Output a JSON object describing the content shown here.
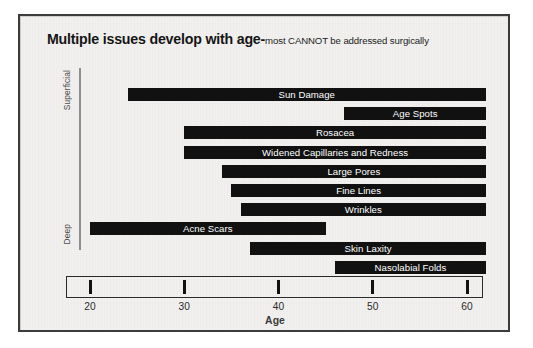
{
  "title": {
    "main": "Multiple issues develop with age-",
    "subtitle": "most CANNOT be addressed surgically"
  },
  "depth_axis": {
    "top_label": "Superficial",
    "bottom_label": "Deep"
  },
  "colors": {
    "bar": "#111111",
    "bar_text": "#ffffff",
    "background": "#f2f1ef",
    "frame_border": "#3b3b3b",
    "axis": "#2a2a2a",
    "depth_axis": "#8d8d8d"
  },
  "chart_data": {
    "type": "bar",
    "orientation": "horizontal",
    "variant": "range-bar",
    "xlabel": "Age",
    "ylabel": "",
    "xlim": [
      17,
      63
    ],
    "xticks": [
      20,
      30,
      40,
      50,
      60
    ],
    "xtick_labels": [
      "20",
      "30",
      "40",
      "50",
      "60"
    ],
    "grid": false,
    "legend": false,
    "y_axis_annotation": {
      "top": "Superficial",
      "bottom": "Deep"
    },
    "categories": [
      "Sun Damage",
      "Age Spots",
      "Rosacea",
      "Widened Capillaries and Redness",
      "Large Pores",
      "Fine Lines",
      "Wrinkles",
      "Acne Scars",
      "Skin Laxity",
      "Nasolabial Folds"
    ],
    "ranges": [
      {
        "label": "Sun Damage",
        "start": 24,
        "end": 62
      },
      {
        "label": "Age Spots",
        "start": 47,
        "end": 62
      },
      {
        "label": "Rosacea",
        "start": 30,
        "end": 62
      },
      {
        "label": "Widened Capillaries and Redness",
        "start": 30,
        "end": 62
      },
      {
        "label": "Large Pores",
        "start": 34,
        "end": 62
      },
      {
        "label": "Fine Lines",
        "start": 35,
        "end": 62
      },
      {
        "label": "Wrinkles",
        "start": 36,
        "end": 62
      },
      {
        "label": "Acne Scars",
        "start": 20,
        "end": 45
      },
      {
        "label": "Skin Laxity",
        "start": 37,
        "end": 62
      },
      {
        "label": "Nasolabial Folds",
        "start": 46,
        "end": 62
      }
    ]
  }
}
